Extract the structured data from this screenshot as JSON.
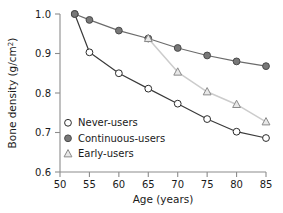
{
  "chart_data": {
    "type": "line",
    "title": "",
    "xlabel": "Age (years)",
    "ylabel": "Bone density (g/cm2)",
    "ylabel_parts": {
      "main": "Bone density (g",
      "slash": "/",
      "unit": "cm",
      "exponent": "2",
      "close": ")"
    },
    "xlim": [
      50,
      85
    ],
    "ylim": [
      0.6,
      1.0
    ],
    "xticks": [
      50,
      55,
      60,
      65,
      70,
      75,
      80,
      85
    ],
    "yticks": [
      0.6,
      0.7,
      0.8,
      0.9,
      1.0
    ],
    "xtick_labels": [
      "50",
      "55",
      "60",
      "65",
      "70",
      "75",
      "80",
      "85"
    ],
    "ytick_labels": [
      "0.6",
      "0.7",
      "0.8",
      "0.9",
      "1.0"
    ],
    "grid": false,
    "legend_position": "lower-left-inside",
    "series": [
      {
        "name": "Never-users",
        "marker": "open-circle",
        "color": "#3a3a3a",
        "marker_fill": "#ffffff",
        "marker_edge": "#2b2b2b",
        "x": [
          52.5,
          55,
          60,
          65,
          70,
          75,
          80,
          85
        ],
        "values": [
          1.0,
          0.903,
          0.85,
          0.811,
          0.773,
          0.734,
          0.702,
          0.686
        ]
      },
      {
        "name": "Continuous-users",
        "marker": "filled-circle",
        "color": "#6b6b6b",
        "marker_fill": "#787878",
        "marker_edge": "#4a4a4a",
        "x": [
          52.5,
          55,
          60,
          65,
          70,
          75,
          80,
          85
        ],
        "values": [
          1.0,
          0.985,
          0.958,
          0.938,
          0.914,
          0.895,
          0.88,
          0.868
        ]
      },
      {
        "name": "Early-users",
        "marker": "open-triangle",
        "color": "#cccccc",
        "marker_fill": "#e8e8e8",
        "marker_edge": "#8a8a8a",
        "x": [
          65,
          70,
          75,
          80,
          85
        ],
        "values": [
          0.938,
          0.853,
          0.803,
          0.771,
          0.727
        ]
      }
    ],
    "legend": [
      {
        "label": "Never-users",
        "marker": "open-circle"
      },
      {
        "label": "Continuous-users",
        "marker": "filled-circle"
      },
      {
        "label": "Early-users",
        "marker": "open-triangle"
      }
    ]
  }
}
